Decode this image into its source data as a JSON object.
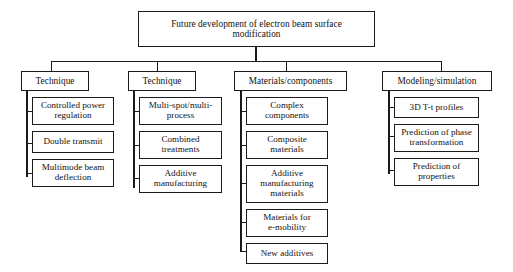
{
  "diagram": {
    "type": "tree",
    "orientation": "top-down",
    "root": {
      "label": "Future development of electron beam surface\nmodification"
    },
    "branches": [
      {
        "header": "Technique",
        "children": [
          "Controlled power\nregulation",
          "Double transmit",
          "Multimode beam\ndeflection"
        ]
      },
      {
        "header": "Technique",
        "children": [
          "Multi-spot/multi-\nprocess",
          "Combined\ntreatments",
          "Additive\nmanufacturing"
        ]
      },
      {
        "header": "Materials/components",
        "children": [
          "Complex\ncomponents",
          "Composite\nmaterials",
          "Additive\nmanufacturing\nmaterials",
          "Materials for\ne-mobility",
          "New additives"
        ]
      },
      {
        "header": "Modeling/simulation",
        "children": [
          "3D T-t profiles",
          "Prediction of phase\ntransformation",
          "Prediction of\nproperties"
        ]
      }
    ]
  },
  "colors": {
    "background": "#ffffff",
    "box_fill": "#ffffff",
    "box_border": "#1a1a1a",
    "connector": "#1a1a1a",
    "text": "#111111"
  }
}
